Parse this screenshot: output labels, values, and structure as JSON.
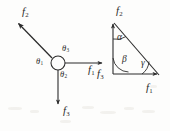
{
  "figure": {
    "background_color": "#fdfdfc",
    "ink_color": "#2b2b2b"
  },
  "free_body": {
    "name": "concurrent-force-diagram",
    "node": {
      "cx": 58,
      "cy": 63,
      "r": 7
    },
    "forces": [
      {
        "id": "f1",
        "label": "f",
        "subscript": "1",
        "direction": "right",
        "from": [
          65,
          63
        ],
        "to": [
          104,
          63
        ],
        "label_pos": [
          92,
          70
        ]
      },
      {
        "id": "f2",
        "label": "f",
        "subscript": "2",
        "direction": "up-left",
        "from": [
          52,
          58
        ],
        "to": [
          17,
          22
        ],
        "label_pos": [
          22,
          13
        ]
      },
      {
        "id": "f3",
        "label": "f",
        "subscript": "3",
        "direction": "down",
        "from": [
          58,
          70
        ],
        "to": [
          58,
          106
        ],
        "label_pos": [
          62,
          112
        ]
      }
    ],
    "angles": [
      {
        "id": "theta1",
        "label": "θ",
        "subscript": "1",
        "label_pos": [
          39,
          60
        ],
        "between": [
          "f2",
          "f3"
        ]
      },
      {
        "id": "theta2",
        "label": "θ",
        "subscript": "2",
        "label_pos": [
          62,
          74
        ],
        "between": [
          "f1",
          "f3"
        ]
      },
      {
        "id": "theta3",
        "label": "θ",
        "subscript": "3",
        "label_pos": [
          64,
          48
        ],
        "between": [
          "f1",
          "f2"
        ]
      }
    ]
  },
  "force_triangle": {
    "name": "force-triangle-diagram",
    "vertices": {
      "top": [
        113,
        22
      ],
      "bottom_left": [
        113,
        74
      ],
      "bottom_right": [
        159,
        74
      ]
    },
    "sides": [
      {
        "id": "f2-side",
        "label": "f",
        "subscript": "2",
        "from": [
          113,
          74
        ],
        "to": [
          113,
          22
        ],
        "arrow": "up",
        "label_pos": [
          116,
          11
        ]
      },
      {
        "id": "f3-side",
        "label": "f",
        "subscript": "3",
        "from": [
          113,
          22
        ],
        "to": [
          113,
          74
        ],
        "arrow": "none",
        "label_pos": [
          98,
          74
        ]
      },
      {
        "id": "f1-side",
        "label": "f",
        "subscript": "1",
        "from": [
          113,
          74
        ],
        "to": [
          159,
          74
        ],
        "arrow": "right",
        "label_pos": [
          148,
          89
        ]
      },
      {
        "id": "hypotenuse",
        "label": "",
        "subscript": "",
        "from": [
          118,
          26
        ],
        "to": [
          157,
          72
        ],
        "arrow": "none",
        "label_pos": [
          0,
          0
        ]
      }
    ],
    "angles": [
      {
        "id": "alpha",
        "label": "α",
        "vertex": "top",
        "label_pos": [
          117,
          37
        ]
      },
      {
        "id": "beta",
        "label": "β",
        "vertex": "bottom_left",
        "label_pos": [
          122,
          60
        ]
      },
      {
        "id": "gamma",
        "label": "γ",
        "vertex": "bottom_right",
        "label_pos": [
          142,
          64
        ]
      }
    ]
  }
}
